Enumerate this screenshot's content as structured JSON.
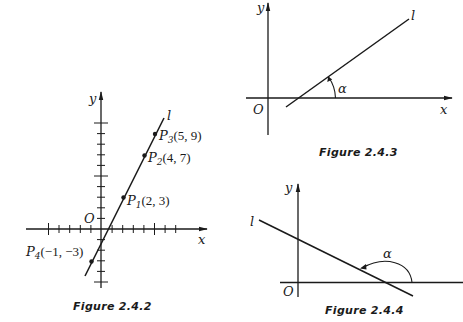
{
  "figures": [
    {
      "id": "fig-2-4-2",
      "caption": "Figure 2.4.2",
      "axes": {
        "x_label": "x",
        "y_label": "y",
        "origin_label": "O"
      },
      "line_label": "l",
      "points": [
        {
          "name": "P",
          "sub": "1",
          "coords": "(2, 3)",
          "x": 2,
          "y": 3
        },
        {
          "name": "P",
          "sub": "2",
          "coords": "(4, 7)",
          "x": 4,
          "y": 7
        },
        {
          "name": "P",
          "sub": "3",
          "coords": "(5, 9)",
          "x": 5,
          "y": 9
        },
        {
          "name": "P",
          "sub": "4",
          "coords": "(−1, −3)",
          "x": -1,
          "y": -3
        }
      ]
    },
    {
      "id": "fig-2-4-3",
      "caption": "Figure 2.4.3",
      "axes": {
        "x_label": "x",
        "y_label": "y",
        "origin_label": "O"
      },
      "line_label": "l",
      "angle_label": "α"
    },
    {
      "id": "fig-2-4-4",
      "caption": "Figure 2.4.4",
      "axes": {
        "x_label": "x",
        "y_label": "y",
        "origin_label": "O"
      },
      "line_label": "l",
      "angle_label": "α"
    }
  ],
  "colors": {
    "ink": "#1a1a1a",
    "background": "#ffffff"
  }
}
